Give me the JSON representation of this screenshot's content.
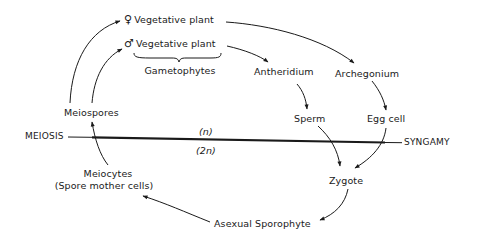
{
  "diagram": {
    "type": "life-cycle",
    "nodes": {
      "female_plant": {
        "symbol": "♀",
        "label": "Vegetative plant"
      },
      "male_plant": {
        "symbol": "♂",
        "label": "Vegetative plant"
      },
      "gametophytes": {
        "label": "Gametophytes"
      },
      "antheridium": {
        "label": "Antheridium"
      },
      "archegonium": {
        "label": "Archegonium"
      },
      "sperm": {
        "label": "Sperm"
      },
      "egg_cell": {
        "label": "Egg cell"
      },
      "meiospores": {
        "label": "Meiospores"
      },
      "zygote": {
        "label": "Zygote"
      },
      "meiocytes": {
        "label": "Meiocytes",
        "sublabel": "(Spore mother cells)"
      },
      "sporophyte": {
        "label": "Asexual Sporophyte"
      }
    },
    "divider": {
      "left_label": "MEIOSIS",
      "right_label": "SYNGAMY",
      "above_label": "(n)",
      "below_label": "(2n)"
    },
    "edges": [
      {
        "from": "meiospores",
        "to": "female_plant"
      },
      {
        "from": "meiospores",
        "to": "male_plant"
      },
      {
        "from": "female_plant",
        "to": "archegonium"
      },
      {
        "from": "male_plant",
        "to": "antheridium"
      },
      {
        "from": "antheridium",
        "to": "sperm"
      },
      {
        "from": "archegonium",
        "to": "egg_cell"
      },
      {
        "from": "sperm",
        "to": "zygote"
      },
      {
        "from": "egg_cell",
        "to": "zygote"
      },
      {
        "from": "zygote",
        "to": "sporophyte"
      },
      {
        "from": "sporophyte",
        "to": "meiocytes"
      },
      {
        "from": "meiocytes",
        "to": "meiospores"
      }
    ],
    "colors": {
      "ink": "#1a1a1a",
      "background": "#ffffff"
    }
  }
}
